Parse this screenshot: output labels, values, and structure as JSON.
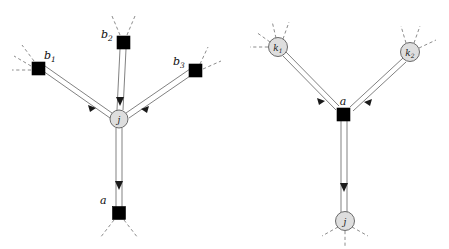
{
  "figure": {
    "title": "",
    "background": "#ffffff",
    "width": 449,
    "height": 249,
    "colors": {
      "factor_square": "#000000",
      "variable_circle_fill": "#dedede",
      "variable_circle_stroke": "#5a5a5a",
      "edge": "#4a4a4a",
      "stub_dashed": "#6f6f6f",
      "label": "#0d0d0d"
    }
  },
  "panels": [
    {
      "id": "left-panel",
      "name": "variable-to-factor-message-panel",
      "center_node": {
        "id": "j",
        "label": "j",
        "subscript": "",
        "shape": "circle",
        "x": 119,
        "y": 119,
        "r": 9
      },
      "nodes": [
        {
          "id": "b1",
          "label": "b",
          "subscript": "1",
          "shape": "square",
          "x": 38.5,
          "y": 68.5,
          "size": 13,
          "label_dx": 6,
          "label_dy": -9
        },
        {
          "id": "b2",
          "label": "b",
          "subscript": "2",
          "shape": "square",
          "x": 123.5,
          "y": 42.5,
          "size": 13,
          "label_dx": -16,
          "label_dy": -7
        },
        {
          "id": "b3",
          "label": "b",
          "subscript": "3",
          "shape": "square",
          "x": 195.5,
          "y": 70.5,
          "size": 13,
          "label_dx": -17,
          "label_dy": -8
        },
        {
          "id": "a",
          "label": "a",
          "subscript": "",
          "shape": "square",
          "x": 119,
          "y": 213,
          "size": 13,
          "label_dx": -15,
          "label_dy": -10
        }
      ],
      "edges": [
        {
          "from": "b1",
          "to": "j",
          "style": "double-line",
          "arrow": "to-target"
        },
        {
          "from": "b2",
          "to": "j",
          "style": "double-line",
          "arrow": "to-target"
        },
        {
          "from": "b3",
          "to": "j",
          "style": "double-line",
          "arrow": "to-target"
        },
        {
          "from": "j",
          "to": "a",
          "style": "double-line",
          "arrow": "to-target"
        }
      ],
      "stub_count": 8
    },
    {
      "id": "right-panel",
      "name": "factor-to-variable-message-panel",
      "center_node": {
        "id": "a",
        "label": "a",
        "subscript": "",
        "shape": "square",
        "x": 343.5,
        "y": 114.5,
        "size": 13
      },
      "nodes": [
        {
          "id": "k1",
          "label": "k",
          "subscript": "1",
          "shape": "circle",
          "x": 278,
          "y": 47,
          "r": 9.5
        },
        {
          "id": "k2",
          "label": "k",
          "subscript": "2",
          "shape": "circle",
          "x": 410,
          "y": 52,
          "r": 9.5
        },
        {
          "id": "j",
          "label": "j",
          "subscript": "",
          "shape": "circle",
          "x": 345,
          "y": 221,
          "r": 9.5
        }
      ],
      "edges": [
        {
          "from": "k1",
          "to": "a",
          "style": "double-line",
          "arrow": "to-target"
        },
        {
          "from": "k2",
          "to": "a",
          "style": "double-line",
          "arrow": "to-target"
        },
        {
          "from": "a",
          "to": "j",
          "style": "double-line",
          "arrow": "to-target"
        }
      ],
      "stub_count": 9
    }
  ],
  "labels": {
    "b1": "b",
    "b1_sub": "1",
    "b2": "b",
    "b2_sub": "2",
    "b3": "b",
    "b3_sub": "3",
    "left_j": "j",
    "left_a": "a",
    "k1": "k",
    "k1_sub": "1",
    "k2": "k",
    "k2_sub": "2",
    "right_a": "a",
    "right_j": "j"
  }
}
